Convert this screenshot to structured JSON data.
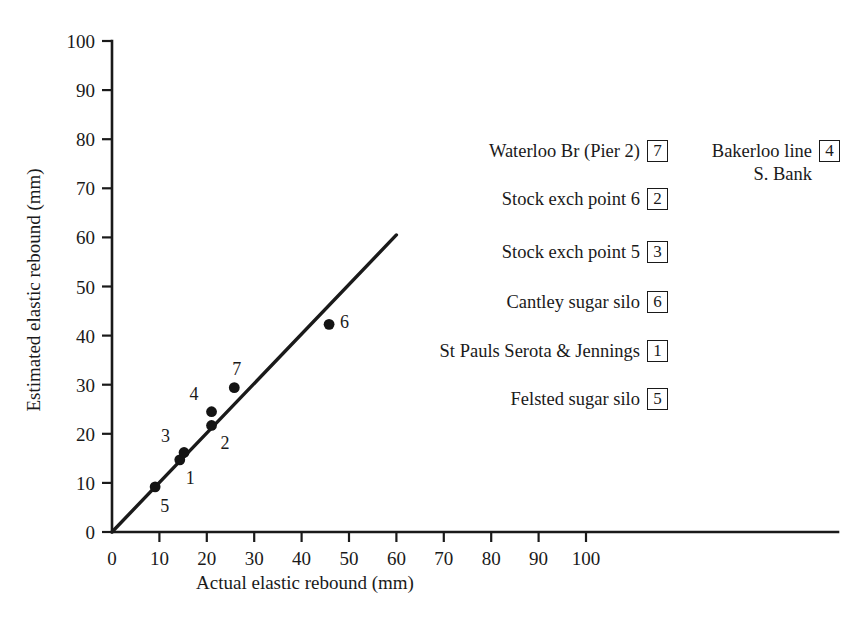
{
  "chart_data": {
    "type": "scatter",
    "title": "",
    "xlabel": "Actual elastic rebound (mm)",
    "ylabel": "Estimated elastic rebound (mm)",
    "xlim": [
      0,
      100
    ],
    "ylim": [
      0,
      100
    ],
    "xticks": [
      "0",
      "10",
      "20",
      "30",
      "40",
      "50",
      "60",
      "70",
      "80",
      "90",
      "100"
    ],
    "yticks": [
      "0",
      "10",
      "20",
      "30",
      "40",
      "50",
      "60",
      "70",
      "80",
      "90",
      "100"
    ],
    "grid": false,
    "legend_position": "right",
    "axis_color": "#1a1a1a",
    "marker_color": "#141414",
    "points": [
      {
        "id": "1",
        "name": "St Pauls Serota & Jennings",
        "x": 14.3,
        "y": 14.7,
        "label_dx": 6,
        "label_dy": 24
      },
      {
        "id": "2",
        "name": "Stock exch point 6",
        "x": 21.0,
        "y": 21.7,
        "label_dx": 9,
        "label_dy": 24
      },
      {
        "id": "3",
        "name": "Stock exch point 5",
        "x": 15.2,
        "y": 16.2,
        "label_dx": -23,
        "label_dy": -10
      },
      {
        "id": "4",
        "name": "Bakerloo line S. Bank",
        "x": 21.0,
        "y": 24.5,
        "label_dx": -22,
        "label_dy": -12
      },
      {
        "id": "5",
        "name": "Felsted sugar silo",
        "x": 9.1,
        "y": 9.2,
        "label_dx": 5,
        "label_dy": 25
      },
      {
        "id": "6",
        "name": "Cantley sugar silo",
        "x": 45.8,
        "y": 42.3,
        "label_dx": 11,
        "label_dy": 4
      },
      {
        "id": "7",
        "name": "Waterloo Br (Pier 2)",
        "x": 25.8,
        "y": 29.4,
        "label_dx": -2,
        "label_dy": -13
      }
    ],
    "fit_line": {
      "x0": 0,
      "y0": 0,
      "x1": 60,
      "y1": 60.5,
      "description": "line of equality"
    }
  },
  "legend": {
    "left_column": [
      {
        "label": "Waterloo Br (Pier 2)",
        "box": "7"
      },
      {
        "label": "Stock exch point 6",
        "box": "2"
      },
      {
        "label": "Stock exch point 5",
        "box": "3"
      },
      {
        "label": "Cantley sugar silo",
        "box": "6"
      },
      {
        "label": "St Pauls Serota & Jennings",
        "box": "1"
      },
      {
        "label": "Felsted sugar silo",
        "box": "5"
      }
    ],
    "right_column": [
      {
        "label": "Bakerloo line\nS. Bank",
        "box": "4"
      }
    ]
  }
}
